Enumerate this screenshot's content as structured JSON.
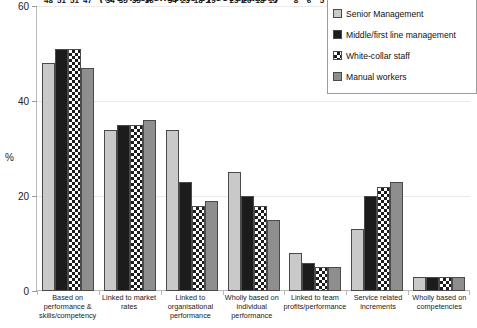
{
  "chart_data": {
    "type": "bar",
    "title": "(% of respondents by occupation)",
    "xlabel": "",
    "ylabel": "%",
    "ylim": [
      0,
      60
    ],
    "yticks": [
      0,
      20,
      40,
      60
    ],
    "grid": true,
    "legend_position": "top-right",
    "categories": [
      "Based on performance & skills/competency",
      "Linked to market rates",
      "Linked to organisational performance",
      "Wholly based on individual performance",
      "Linked to team profits/performance",
      "Service related increments",
      "Wholly based on competencies"
    ],
    "series": [
      {
        "name": "Senior Management",
        "swatch": "light-gray",
        "color": "#c9c9c9",
        "values": [
          48,
          34,
          34,
          25,
          8,
          13,
          3
        ]
      },
      {
        "name": "Middle/first line management",
        "swatch": "black",
        "color": "#1c1c1c",
        "values": [
          51,
          35,
          23,
          20,
          6,
          20,
          3
        ]
      },
      {
        "name": "White-collar staff",
        "swatch": "checkered",
        "color": "#ffffff",
        "values": [
          51,
          35,
          18,
          18,
          5,
          22,
          3
        ]
      },
      {
        "name": "Manual workers",
        "swatch": "mid-gray",
        "color": "#8e8e8e",
        "values": [
          47,
          36,
          19,
          15,
          5,
          23,
          3
        ]
      }
    ]
  }
}
